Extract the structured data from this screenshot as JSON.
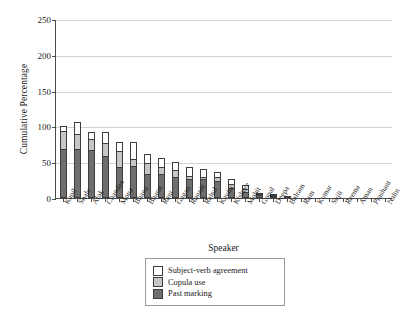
{
  "chart_data": {
    "type": "bar",
    "subtype": "stacked-bar",
    "title": "",
    "xlabel": "Speaker",
    "ylabel": "Cumulative Percentage",
    "ylim": [
      0,
      250
    ],
    "yticks": [
      0,
      50,
      100,
      150,
      200,
      250
    ],
    "grid": true,
    "legend_position": "bottom-center",
    "categories": [
      "Kapil",
      "Shalu",
      "Alok",
      "Chandan",
      "Mona",
      "Bhanu",
      "Bharat",
      "Rani",
      "Gagan",
      "Ronnie",
      "Rahul",
      "Kavita",
      "Kishore",
      "Mohit",
      "Gopal",
      "Deepa",
      "Balram",
      "Ram",
      "Kumar",
      "Sujit",
      "Reema",
      "Aman",
      "Prashant",
      "Nalin"
    ],
    "series": [
      {
        "name": "Past marking",
        "color": "#6e6e6e",
        "values": [
          68,
          68,
          67,
          58,
          43,
          45,
          34,
          33,
          30,
          27,
          26,
          24,
          14,
          9,
          4,
          2,
          1,
          0,
          0,
          0,
          0,
          0,
          0,
          0
        ]
      },
      {
        "name": "Copula use",
        "color": "#c6c6c6",
        "values": [
          26,
          22,
          15,
          19,
          22,
          10,
          15,
          11,
          9,
          4,
          4,
          5,
          6,
          4,
          1,
          1,
          0,
          0,
          0,
          0,
          0,
          0,
          0,
          0
        ]
      },
      {
        "name": "Subject-verb agreement",
        "color": "#ffffff",
        "values": [
          6,
          16,
          10,
          15,
          13,
          23,
          12,
          12,
          11,
          13,
          10,
          8,
          7,
          5,
          1,
          1,
          0,
          0,
          0,
          0,
          0,
          0,
          0,
          0
        ]
      }
    ],
    "totals": [
      100,
      106,
      92,
      92,
      78,
      78,
      61,
      56,
      50,
      44,
      40,
      37,
      27,
      18,
      6,
      4,
      1,
      0,
      0,
      0,
      0,
      0,
      0,
      0
    ]
  },
  "legend": {
    "items": [
      {
        "label": "Subject-verb agreement",
        "color": "#ffffff"
      },
      {
        "label": "Copula use",
        "color": "#c6c6c6"
      },
      {
        "label": "Past marking",
        "color": "#6e6e6e"
      }
    ]
  }
}
